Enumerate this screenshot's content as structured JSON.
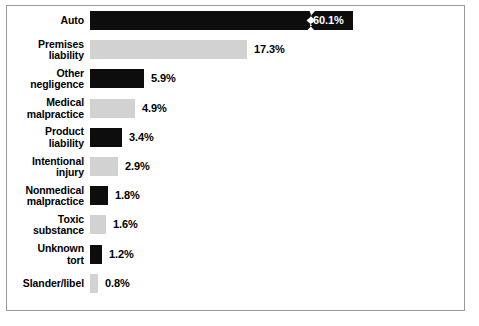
{
  "chart_data": {
    "type": "bar",
    "orientation": "horizontal",
    "title": "",
    "subtitle": "",
    "xlabel": "",
    "ylabel": "",
    "grid": false,
    "legend": null,
    "axis_visible": false,
    "value_suffix": "%",
    "note": "Auto bar is drawn with an axis-break zigzag; its bar is truncated and its value label sits inside the bar in white.",
    "categories": [
      "Auto",
      "Premises liability",
      "Other negligence",
      "Medical malpractice",
      "Product liability",
      "Intentional injury",
      "Nonmedical malpractice",
      "Toxic substance",
      "Unknown tort",
      "Slander/libel"
    ],
    "values": [
      60.1,
      17.3,
      5.9,
      4.9,
      3.4,
      2.9,
      1.8,
      1.6,
      1.2,
      0.8
    ],
    "value_labels": [
      "60.1%",
      "17.3%",
      "5.9%",
      "4.9%",
      "3.4%",
      "2.9%",
      "1.8%",
      "1.6%",
      "1.2%",
      "0.8%"
    ],
    "xlim": [
      0,
      20
    ]
  },
  "style": {
    "bar_dark": "#0d0d0d",
    "bar_light": "#d2d2d2",
    "frame_border": "#9a9a9a",
    "background": "#ffffff",
    "text_color": "#000000",
    "inside_label_color": "#ffffff"
  },
  "rows": [
    {
      "label_line1": "Auto",
      "label_line2": "",
      "value_label": "60.1%",
      "value": 60.1,
      "bar_color": "dark",
      "bar_px": 263,
      "label_inside": true,
      "broken": true
    },
    {
      "label_line1": "Premises",
      "label_line2": "liability",
      "value_label": "17.3%",
      "value": 17.3,
      "bar_color": "light",
      "bar_px": 157,
      "label_inside": false,
      "broken": false
    },
    {
      "label_line1": "Other",
      "label_line2": "negligence",
      "value_label": "5.9%",
      "value": 5.9,
      "bar_color": "dark",
      "bar_px": 54,
      "label_inside": false,
      "broken": false
    },
    {
      "label_line1": "Medical",
      "label_line2": "malpractice",
      "value_label": "4.9%",
      "value": 4.9,
      "bar_color": "light",
      "bar_px": 45,
      "label_inside": false,
      "broken": false
    },
    {
      "label_line1": "Product",
      "label_line2": "liability",
      "value_label": "3.4%",
      "value": 3.4,
      "bar_color": "dark",
      "bar_px": 32,
      "label_inside": false,
      "broken": false
    },
    {
      "label_line1": "Intentional",
      "label_line2": "injury",
      "value_label": "2.9%",
      "value": 2.9,
      "bar_color": "light",
      "bar_px": 28,
      "label_inside": false,
      "broken": false
    },
    {
      "label_line1": "Nonmedical",
      "label_line2": "malpractice",
      "value_label": "1.8%",
      "value": 1.8,
      "bar_color": "dark",
      "bar_px": 18,
      "label_inside": false,
      "broken": false
    },
    {
      "label_line1": "Toxic",
      "label_line2": "substance",
      "value_label": "1.6%",
      "value": 1.6,
      "bar_color": "light",
      "bar_px": 16,
      "label_inside": false,
      "broken": false
    },
    {
      "label_line1": "Unknown",
      "label_line2": "tort",
      "value_label": "1.2%",
      "value": 1.2,
      "bar_color": "dark",
      "bar_px": 12,
      "label_inside": false,
      "broken": false
    },
    {
      "label_line1": "Slander/libel",
      "label_line2": "",
      "value_label": "0.8%",
      "value": 0.8,
      "bar_color": "light",
      "bar_px": 8,
      "label_inside": false,
      "broken": false
    }
  ]
}
